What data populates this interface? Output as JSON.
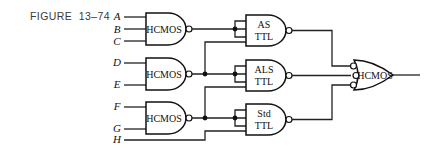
{
  "figure": {
    "label": "FIGURE  13–74"
  },
  "inputs": {
    "A": "A",
    "B": "B",
    "C": "C",
    "D": "D",
    "E": "E",
    "F": "F",
    "G": "G",
    "H": "H"
  },
  "gates": {
    "hcmos1": {
      "label": "HCMOS",
      "type": "NAND",
      "inputs": [
        "A",
        "B",
        "C"
      ]
    },
    "hcmos2": {
      "label": "HCMOS",
      "type": "NAND",
      "inputs": [
        "D",
        "E"
      ]
    },
    "hcmos3": {
      "label": "HCMOS",
      "type": "NAND",
      "inputs": [
        "F",
        "G"
      ]
    },
    "as_ttl": {
      "line1": "AS",
      "line2": "TTL",
      "type": "NAND"
    },
    "als_ttl": {
      "line1": "ALS",
      "line2": "TTL",
      "type": "NAND"
    },
    "std_ttl": {
      "line1": "Std",
      "line2": "TTL",
      "type": "NAND"
    },
    "output": {
      "label": "HCMOS",
      "type": "OR (inverted inputs)"
    }
  }
}
